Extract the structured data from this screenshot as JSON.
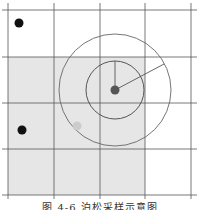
{
  "figure": {
    "caption": "图 4-6  泊松采样示意图",
    "grid": {
      "x_lines": [
        8,
        54,
        100,
        145,
        191
      ],
      "y_lines": [
        10,
        57,
        103,
        149,
        195
      ],
      "line_color": "#555555",
      "shaded_region": {
        "x": 8,
        "y": 57,
        "width": 137,
        "height": 138,
        "color": "#e6e6e6"
      }
    },
    "center_sample": {
      "cx": 115,
      "cy": 90,
      "r": 4.5,
      "color": "#555555"
    },
    "inner_circle": {
      "cx": 115,
      "cy": 90,
      "r": 29,
      "color": "#555555"
    },
    "outer_circle": {
      "cx": 115,
      "cy": 90,
      "r": 56,
      "color": "#666666"
    },
    "radius_lines": [
      {
        "x1": 115,
        "y1": 90,
        "x2": 115,
        "y2": 61
      },
      {
        "x1": 115,
        "y1": 90,
        "x2": 164,
        "y2": 64
      }
    ],
    "candidate_sample": {
      "cx": 77,
      "cy": 126,
      "r": 4.5,
      "color": "#cccccc"
    },
    "existing_samples": [
      {
        "cx": 19,
        "cy": 23,
        "r": 4.5,
        "color": "#111111"
      },
      {
        "cx": 22,
        "cy": 130,
        "r": 4.5,
        "color": "#111111"
      }
    ]
  }
}
